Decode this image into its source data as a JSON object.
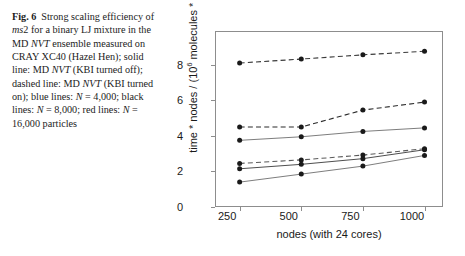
{
  "caption": {
    "fig_label": "Fig. 6",
    "segments": [
      {
        "t": "Strong scaling efficiency of ",
        "s": "n"
      },
      {
        "t": "ms",
        "s": "i"
      },
      {
        "t": "2 for a binary LJ mixture in the MD ",
        "s": "n"
      },
      {
        "t": "NVT",
        "s": "i"
      },
      {
        "t": " ensemble measured on CRAY XC40 (Hazel Hen); solid line: MD ",
        "s": "n"
      },
      {
        "t": "NVT",
        "s": "i"
      },
      {
        "t": " (KBI turned off); dashed line: MD ",
        "s": "n"
      },
      {
        "t": "NVT",
        "s": "i"
      },
      {
        "t": " (KBI turned on); blue lines: ",
        "s": "n"
      },
      {
        "t": "N",
        "s": "i"
      },
      {
        "t": " = 4,000; black lines: ",
        "s": "n"
      },
      {
        "t": "N",
        "s": "i"
      },
      {
        "t": " = 8,000; red lines: ",
        "s": "n"
      },
      {
        "t": "N",
        "s": "i"
      },
      {
        "t": " = 16,000 particles",
        "s": "n"
      }
    ],
    "plain": "Fig. 6 Strong scaling efficiency of ms2 for a binary LJ mixture in the MD NVT ensemble measured on CRAY XC40 (Hazel Hen); solid line: MD NVT (KBI turned off); dashed line: MD NVT (KBI turned on); blue lines: N = 4,000; black lines: N = 8,000; red lines: N = 16,000 particles"
  },
  "chart_data": {
    "type": "line",
    "title": "",
    "xlabel": "nodes (with 24 cores)",
    "ylabel": "time * nodes / (10⁶ molecules * steps) / s",
    "ylabel_prefix": "time * nodes / (10",
    "ylabel_sup": "6",
    "ylabel_suffix": " molecules * steps) / s",
    "x": [
      250,
      500,
      750,
      1000
    ],
    "xticks": [
      "250",
      "500",
      "750",
      "1000"
    ],
    "yticks": [
      "0",
      "2",
      "4",
      "6",
      "8"
    ],
    "xlim": [
      150,
      1075
    ],
    "ylim": [
      0,
      9.9
    ],
    "grid": false,
    "legend": "none (described in caption)",
    "marker": "filled-circle",
    "series": [
      {
        "name": "MD NVT KBI on, N = 16,000",
        "style": "dashed",
        "color": "#3a3a3a",
        "values": [
          8.1,
          8.32,
          8.56,
          8.76
        ]
      },
      {
        "name": "MD NVT KBI on, N = 8,000",
        "style": "dashed",
        "color": "#2b2b2b",
        "values": [
          4.5,
          4.5,
          5.45,
          5.9
        ]
      },
      {
        "name": "MD NVT KBI off, N = 16,000",
        "style": "solid",
        "color": "#6e6e6e",
        "values": [
          3.75,
          3.95,
          4.25,
          4.45
        ]
      },
      {
        "name": "MD NVT KBI on, N = 4,000",
        "style": "dashed",
        "color": "#5a5a5a",
        "values": [
          2.45,
          2.65,
          2.92,
          3.28
        ]
      },
      {
        "name": "MD NVT KBI off, N = 8,000",
        "style": "solid",
        "color": "#3a3a3a",
        "values": [
          2.15,
          2.4,
          2.72,
          3.22
        ]
      },
      {
        "name": "MD NVT KBI off, N = 4,000",
        "style": "solid",
        "color": "#6e6e6e",
        "values": [
          1.4,
          1.85,
          2.3,
          2.9
        ]
      }
    ]
  },
  "colors": {
    "axis": "#8d8d8d",
    "text": "#1a1a1a",
    "marker": "#1a1a1a",
    "background": "#ffffff"
  }
}
